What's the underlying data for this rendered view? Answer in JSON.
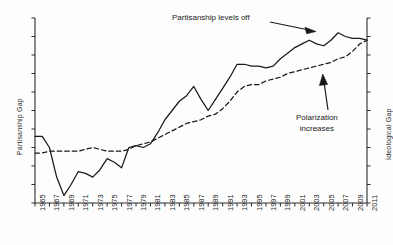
{
  "chart_data": {
    "type": "line",
    "title": "",
    "xlabel": "",
    "ylabel": "Partisanship Gap",
    "ylabel_right": "Ideological Gap",
    "grid": false,
    "legend": "none",
    "xlim": [
      1965,
      2011
    ],
    "ylim": [
      0,
      100
    ],
    "x": [
      1965,
      1966,
      1967,
      1968,
      1969,
      1970,
      1971,
      1972,
      1973,
      1974,
      1975,
      1976,
      1977,
      1978,
      1979,
      1980,
      1981,
      1982,
      1983,
      1984,
      1985,
      1986,
      1987,
      1988,
      1989,
      1990,
      1991,
      1992,
      1993,
      1994,
      1995,
      1996,
      1997,
      1998,
      1999,
      2000,
      2001,
      2002,
      2003,
      2004,
      2005,
      2006,
      2007,
      2008,
      2009,
      2010,
      2011
    ],
    "xticks": [
      1965,
      1967,
      1969,
      1971,
      1973,
      1975,
      1977,
      1979,
      1981,
      1983,
      1985,
      1987,
      1989,
      1991,
      1993,
      1995,
      1997,
      1999,
      2001,
      2003,
      2005,
      2007,
      2009,
      2011
    ],
    "xticklabels": [
      "1965",
      "1967",
      "1969",
      "1971",
      "1973",
      "1975",
      "1977",
      "1979",
      "1981",
      "1983",
      "1985",
      "1987",
      "1989",
      "1991",
      "1993",
      "1995",
      "1997",
      "1999",
      "2001",
      "2003",
      "2005",
      "2007",
      "2009",
      "2011"
    ],
    "series": [
      {
        "name": "Partisanship Gap",
        "axis": "left",
        "style": "solid",
        "color": "#1a1a1a",
        "values": [
          36,
          36,
          30,
          14,
          4,
          10,
          17,
          16,
          14,
          18,
          24,
          22,
          19,
          30,
          31,
          30,
          32,
          38,
          45,
          50,
          55,
          58,
          63,
          56,
          50,
          56,
          62,
          68,
          75,
          75,
          74,
          74,
          73,
          74,
          78,
          81,
          84,
          86,
          88,
          86,
          85,
          88,
          92,
          90,
          89,
          89,
          88
        ]
      },
      {
        "name": "Ideological Gap",
        "axis": "right",
        "style": "dashed",
        "color": "#1a1a1a",
        "values": [
          27,
          27,
          28,
          28,
          28,
          28,
          28,
          29,
          30,
          29,
          28,
          28,
          28,
          29,
          31,
          32,
          33,
          35,
          37,
          39,
          41,
          43,
          44,
          45,
          47,
          48,
          51,
          55,
          60,
          63,
          64,
          64,
          66,
          67,
          68,
          70,
          71,
          72,
          73,
          74,
          75,
          76,
          78,
          79,
          82,
          86,
          88
        ]
      }
    ],
    "annotations": [
      {
        "id": "levels-off",
        "text": "Partisanship levels off",
        "arrow": "points right toward the partisanship curve near 2005"
      },
      {
        "id": "polarization",
        "text_line1": "Polarization",
        "text_line2": "increases",
        "arrow": "points up toward the ideological gap dashed curve near 2006"
      }
    ]
  }
}
